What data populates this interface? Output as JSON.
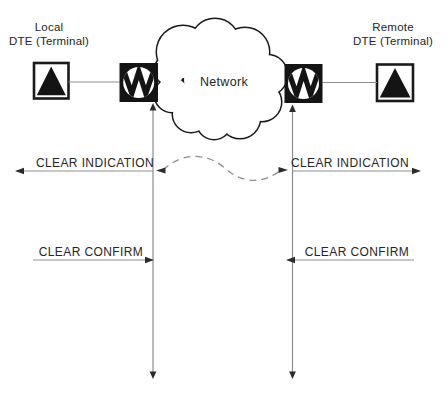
{
  "diagram": {
    "network": {
      "label": "Network"
    },
    "local_dte": {
      "label_line1": "Local",
      "label_line2": "DTE (Terminal)"
    },
    "remote_dte": {
      "label_line1": "Remote",
      "label_line2": "DTE (Terminal)"
    },
    "messages": {
      "clear_indication_left": "CLEAR INDICATION",
      "clear_indication_right": "CLEAR INDICATION",
      "clear_confirm_left": "CLEAR CONFIRM",
      "clear_confirm_right": "CLEAR CONFIRM"
    },
    "colors": {
      "background": "#ffffff",
      "ink": "#1a1a1a",
      "text": "#262626",
      "line_gray": "#8e8e8e",
      "arrowhead": "#2b2b2b"
    }
  }
}
